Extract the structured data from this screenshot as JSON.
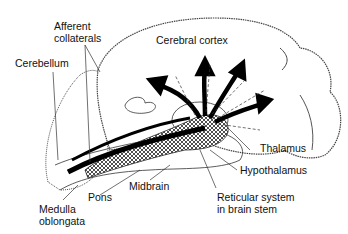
{
  "diagram": {
    "labels": {
      "afferent_1": "Afferent",
      "afferent_2": "collaterals",
      "cerebral_cortex": "Cerebral cortex",
      "cerebellum": "Cerebellum",
      "thalamus": "Thalamus",
      "hypothalamus": "Hypothalamus",
      "midbrain": "Midbrain",
      "pons": "Pons",
      "reticular_1": "Reticular system",
      "reticular_2": "in brain stem",
      "medulla_1": "Medulla",
      "medulla_2": "oblongata"
    }
  }
}
